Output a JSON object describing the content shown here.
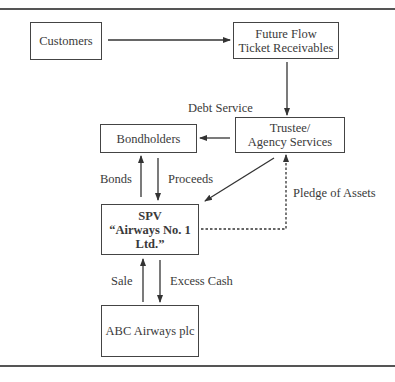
{
  "diagram": {
    "nodes": {
      "customers": {
        "lines": [
          "Customers"
        ]
      },
      "future_flow": {
        "lines": [
          "Future Flow",
          "Ticket Receivables"
        ]
      },
      "trustee": {
        "lines": [
          "Trustee/",
          "Agency Services"
        ]
      },
      "bondholders": {
        "lines": [
          "Bondholders"
        ]
      },
      "spv": {
        "lines": [
          "SPV",
          "“Airways No. 1",
          "Ltd.”"
        ]
      },
      "abc": {
        "lines": [
          "ABC Airways plc"
        ]
      }
    },
    "edge_labels": {
      "debt_service": "Debt Service",
      "bonds": "Bonds",
      "proceeds": "Proceeds",
      "pledge": "Pledge of Assets",
      "sale": "Sale",
      "excess_cash": "Excess Cash"
    },
    "edges": [
      {
        "from": "customers",
        "to": "future_flow",
        "style": "solid"
      },
      {
        "from": "future_flow",
        "to": "trustee",
        "style": "solid",
        "label": "Debt Service"
      },
      {
        "from": "trustee",
        "to": "bondholders",
        "style": "solid"
      },
      {
        "from": "trustee",
        "to": "spv",
        "style": "solid"
      },
      {
        "from": "spv",
        "to": "bondholders",
        "style": "solid",
        "label": "Bonds"
      },
      {
        "from": "bondholders",
        "to": "spv",
        "style": "solid",
        "label": "Proceeds"
      },
      {
        "from": "spv",
        "to": "trustee",
        "style": "dashed",
        "label": "Pledge of Assets"
      },
      {
        "from": "abc",
        "to": "spv",
        "style": "solid",
        "label": "Sale"
      },
      {
        "from": "spv",
        "to": "abc",
        "style": "solid",
        "label": "Excess Cash"
      }
    ],
    "colors": {
      "line": "#444444",
      "text": "#3a3a3a",
      "background": "#ffffff"
    }
  }
}
